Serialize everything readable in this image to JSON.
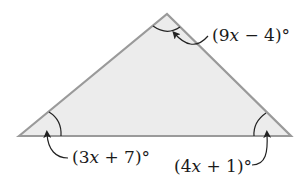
{
  "diagram": {
    "type": "triangle",
    "colors": {
      "fill": "#ececec",
      "stroke": "#9a9a9a",
      "arc": "#222222",
      "arrow": "#222222",
      "text": "#1a1a1a"
    },
    "vertices": {
      "left": {
        "x": 19,
        "y": 136
      },
      "top": {
        "x": 167,
        "y": 14
      },
      "right": {
        "x": 291,
        "y": 136
      }
    },
    "angles": [
      {
        "vertex": "top",
        "label_open": "(9",
        "label_var": "x",
        "label_rest": " − 4)°",
        "expression": "(9x − 4)°"
      },
      {
        "vertex": "left",
        "label_open": "(3",
        "label_var": "x",
        "label_rest": " + 7)°",
        "expression": "(3x + 7)°"
      },
      {
        "vertex": "right",
        "label_open": "(4",
        "label_var": "x",
        "label_rest": " + 1)°",
        "expression": "(4x + 1)°"
      }
    ]
  }
}
